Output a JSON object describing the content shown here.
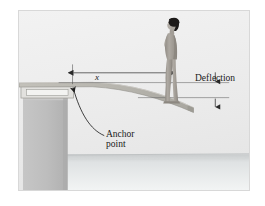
{
  "figure": {
    "kind": "engineering-illustration",
    "labels": {
      "deflection": "Deflection",
      "anchor_line1": "Anchor",
      "anchor_line2": "point",
      "distance_symbol": "x"
    },
    "icons": {
      "dimension_arrow": "double-headed-arrow-icon",
      "anchor_pointer": "curved-arrow-icon",
      "deflection_arrow_top": "arrow-down-icon",
      "deflection_arrow_bottom": "arrow-up-icon",
      "diver": "person-standing-icon",
      "water": "water-surface-icon",
      "pillar": "concrete-pillar-icon",
      "fulcrum": "fulcrum-frame-icon",
      "board": "diving-board-icon"
    },
    "colors": {
      "page_background": "#ffffff",
      "frame_border": "#d8d8d8",
      "sky": "#efefef",
      "board": "#b9b7b0",
      "board_edge": "#8f8d86",
      "pillar": "#bcbcbc",
      "pillar_dark": "#a9a9a9",
      "water": "#d9dcdd",
      "skin": "#a8a39c",
      "hair": "#1c1a19",
      "ink": "#1a1a1a",
      "reference_line": "#6e6e6e"
    }
  }
}
